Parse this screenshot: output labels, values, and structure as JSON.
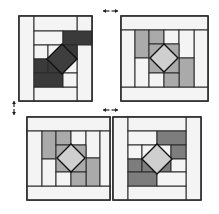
{
  "diagram": {
    "title": "",
    "colors": {
      "outline": "#2a2a2a",
      "white": "#f4f4f4",
      "light": "#e6e6e6",
      "mid": "#aaaaaa",
      "medium_dark": "#7d7d7d",
      "dark": "#3a3a3a",
      "diamond_light": "#cfcfcf",
      "diamond_dark": "#3e3e3e",
      "arrow": "#222222"
    },
    "arrows": [
      {
        "name": "arrow-top-horizontal",
        "type": "double-h",
        "x1": 103,
        "x2": 118,
        "y": 11
      },
      {
        "name": "arrow-left-vertical",
        "type": "double-v",
        "x": 14,
        "y1": 101,
        "y2": 115
      },
      {
        "name": "arrow-middle-horizontal",
        "type": "double-h",
        "x1": 103,
        "x2": 118,
        "y": 110
      }
    ],
    "blocks": [
      {
        "name": "block-top-left",
        "x": 19,
        "y": 16,
        "w": 73,
        "h": 85,
        "rects": [
          {
            "x": 19,
            "y": 16,
            "w": 15,
            "h": 85,
            "fill": "white"
          },
          {
            "x": 77,
            "y": 16,
            "w": 15,
            "h": 85,
            "fill": "white"
          },
          {
            "x": 34,
            "y": 16,
            "w": 43,
            "h": 15,
            "fill": "white"
          },
          {
            "x": 34,
            "y": 87,
            "w": 43,
            "h": 14,
            "fill": "white"
          },
          {
            "x": 34,
            "y": 31,
            "w": 29,
            "h": 14,
            "fill": "white"
          },
          {
            "x": 63,
            "y": 31,
            "w": 29,
            "h": 14,
            "fill": "dark"
          },
          {
            "x": 34,
            "y": 45,
            "w": 14,
            "h": 14,
            "fill": "white"
          },
          {
            "x": 48,
            "y": 45,
            "w": 29,
            "h": 14,
            "fill": "white"
          },
          {
            "x": 77,
            "y": 45,
            "w": 0,
            "h": 0,
            "fill": "white"
          },
          {
            "x": 63,
            "y": 45,
            "w": 14,
            "h": 14,
            "fill": "dark"
          },
          {
            "x": 34,
            "y": 59,
            "w": 14,
            "h": 14,
            "fill": "dark"
          },
          {
            "x": 48,
            "y": 59,
            "w": 15,
            "h": 14,
            "fill": "dark"
          },
          {
            "x": 63,
            "y": 59,
            "w": 14,
            "h": 14,
            "fill": "white"
          },
          {
            "x": 34,
            "y": 73,
            "w": 29,
            "h": 14,
            "fill": "dark"
          },
          {
            "x": 63,
            "y": 73,
            "w": 14,
            "h": 14,
            "fill": "white"
          }
        ],
        "diamond": {
          "cx": 62,
          "cy": 59,
          "r": 15,
          "fill": "diamond_dark",
          "angle": 0
        }
      },
      {
        "name": "block-top-right",
        "x": 121,
        "y": 16,
        "w": 87,
        "h": 85,
        "rects": [
          {
            "x": 121,
            "y": 16,
            "w": 87,
            "h": 14,
            "fill": "white"
          },
          {
            "x": 121,
            "y": 87,
            "w": 87,
            "h": 14,
            "fill": "white"
          },
          {
            "x": 121,
            "y": 30,
            "w": 14,
            "h": 57,
            "fill": "white"
          },
          {
            "x": 194,
            "y": 30,
            "w": 14,
            "h": 57,
            "fill": "white"
          },
          {
            "x": 135,
            "y": 30,
            "w": 14,
            "h": 28,
            "fill": "mid"
          },
          {
            "x": 135,
            "y": 58,
            "w": 14,
            "h": 29,
            "fill": "white"
          },
          {
            "x": 149,
            "y": 30,
            "w": 15,
            "h": 14,
            "fill": "mid"
          },
          {
            "x": 164,
            "y": 30,
            "w": 15,
            "h": 14,
            "fill": "white"
          },
          {
            "x": 179,
            "y": 30,
            "w": 15,
            "h": 28,
            "fill": "white"
          },
          {
            "x": 179,
            "y": 58,
            "w": 15,
            "h": 29,
            "fill": "mid"
          },
          {
            "x": 149,
            "y": 44,
            "w": 30,
            "h": 29,
            "fill": "mid"
          },
          {
            "x": 149,
            "y": 73,
            "w": 15,
            "h": 14,
            "fill": "white"
          },
          {
            "x": 164,
            "y": 73,
            "w": 15,
            "h": 14,
            "fill": "mid"
          }
        ],
        "diamond": {
          "cx": 164,
          "cy": 58,
          "r": 14,
          "fill": "diamond_light",
          "angle": 0
        }
      },
      {
        "name": "block-bottom-left",
        "x": 27,
        "y": 117,
        "w": 83,
        "h": 83,
        "rects": [
          {
            "x": 27,
            "y": 117,
            "w": 83,
            "h": 14,
            "fill": "white"
          },
          {
            "x": 27,
            "y": 186,
            "w": 83,
            "h": 14,
            "fill": "white"
          },
          {
            "x": 27,
            "y": 131,
            "w": 15,
            "h": 55,
            "fill": "white"
          },
          {
            "x": 42,
            "y": 131,
            "w": 14,
            "h": 28,
            "fill": "mid"
          },
          {
            "x": 42,
            "y": 159,
            "w": 14,
            "h": 27,
            "fill": "white"
          },
          {
            "x": 56,
            "y": 131,
            "w": 15,
            "h": 14,
            "fill": "mid"
          },
          {
            "x": 71,
            "y": 131,
            "w": 15,
            "h": 14,
            "fill": "white"
          },
          {
            "x": 86,
            "y": 131,
            "w": 14,
            "h": 27,
            "fill": "white"
          },
          {
            "x": 86,
            "y": 158,
            "w": 14,
            "h": 28,
            "fill": "mid"
          },
          {
            "x": 100,
            "y": 131,
            "w": 10,
            "h": 55,
            "fill": "white"
          },
          {
            "x": 56,
            "y": 145,
            "w": 30,
            "h": 27,
            "fill": "mid"
          },
          {
            "x": 56,
            "y": 172,
            "w": 15,
            "h": 14,
            "fill": "white"
          },
          {
            "x": 71,
            "y": 172,
            "w": 15,
            "h": 14,
            "fill": "mid"
          }
        ],
        "diamond": {
          "cx": 71,
          "cy": 158,
          "r": 14,
          "fill": "diamond_light",
          "angle": 0
        }
      },
      {
        "name": "block-bottom-right",
        "x": 113,
        "y": 117,
        "w": 88,
        "h": 83,
        "rects": [
          {
            "x": 113,
            "y": 117,
            "w": 15,
            "h": 83,
            "fill": "white"
          },
          {
            "x": 186,
            "y": 117,
            "w": 15,
            "h": 83,
            "fill": "white"
          },
          {
            "x": 128,
            "y": 117,
            "w": 58,
            "h": 14,
            "fill": "white"
          },
          {
            "x": 128,
            "y": 186,
            "w": 58,
            "h": 14,
            "fill": "white"
          },
          {
            "x": 128,
            "y": 131,
            "w": 29,
            "h": 14,
            "fill": "white"
          },
          {
            "x": 157,
            "y": 131,
            "w": 29,
            "h": 14,
            "fill": "medium_dark"
          },
          {
            "x": 128,
            "y": 145,
            "w": 14,
            "h": 14,
            "fill": "white"
          },
          {
            "x": 142,
            "y": 145,
            "w": 29,
            "h": 14,
            "fill": "white"
          },
          {
            "x": 171,
            "y": 145,
            "w": 15,
            "h": 14,
            "fill": "medium_dark"
          },
          {
            "x": 128,
            "y": 159,
            "w": 14,
            "h": 13,
            "fill": "medium_dark"
          },
          {
            "x": 142,
            "y": 159,
            "w": 15,
            "h": 13,
            "fill": "medium_dark"
          },
          {
            "x": 157,
            "y": 159,
            "w": 14,
            "h": 13,
            "fill": "medium_dark"
          },
          {
            "x": 171,
            "y": 159,
            "w": 15,
            "h": 13,
            "fill": "white"
          },
          {
            "x": 128,
            "y": 172,
            "w": 29,
            "h": 14,
            "fill": "medium_dark"
          },
          {
            "x": 157,
            "y": 172,
            "w": 29,
            "h": 14,
            "fill": "white"
          }
        ],
        "diamond": {
          "cx": 157,
          "cy": 159,
          "r": 15,
          "fill": "diamond_light",
          "angle": 0
        }
      }
    ]
  }
}
